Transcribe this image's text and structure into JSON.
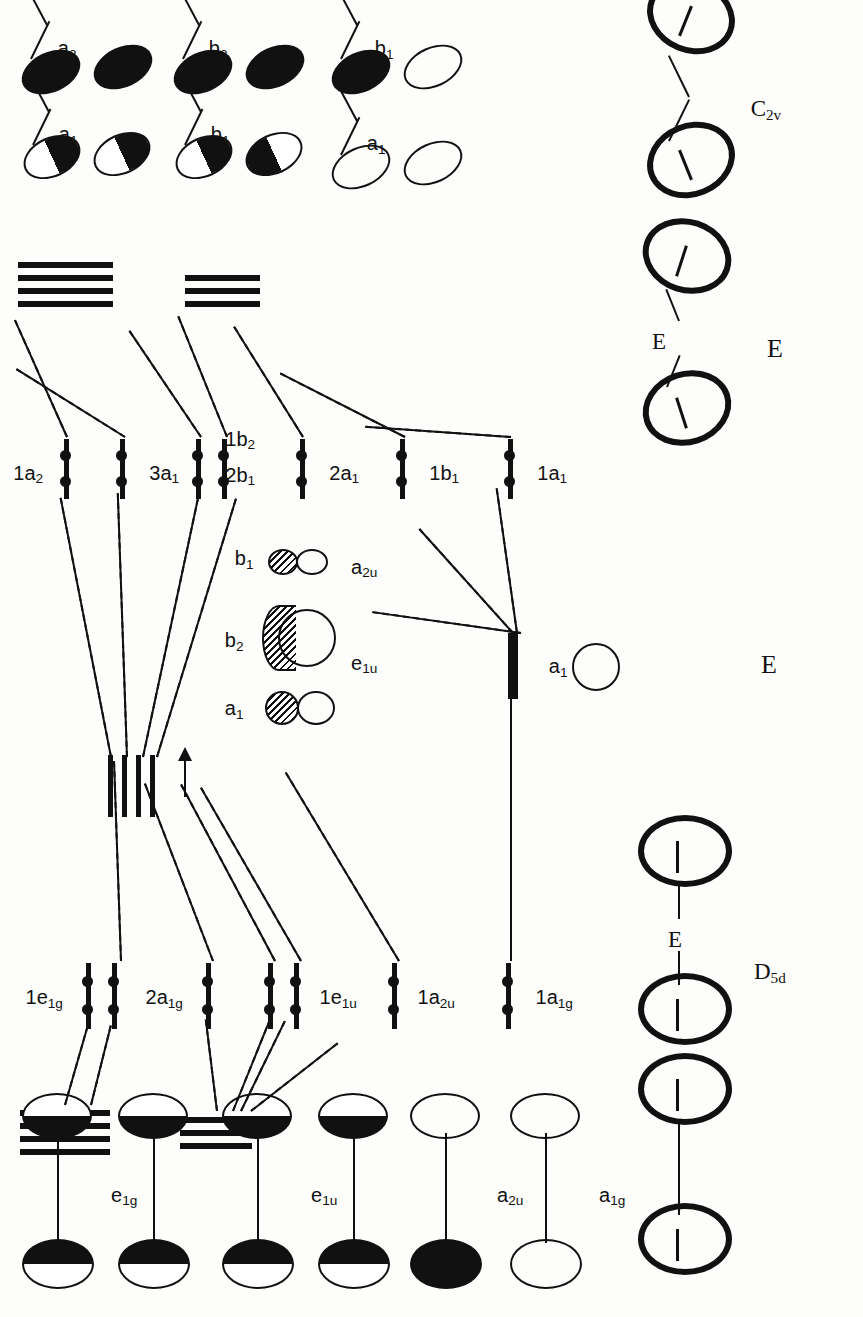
{
  "figure": {
    "number": "Figure 1-3",
    "caption_line1": "General molecular orbital diagrams for 14 electron main group sandwich complexes with parallel (D5d) and bent",
    "caption_line2": "(C2v) structures, showing only occupied molecular orbitals",
    "caption_full": "General molecular orbital diagrams for 14 electron main group sandwich complexes with parallel (D5d) and bent (C2v) structures, showing only occupied molecular orbitals"
  },
  "structures": {
    "row_labels": [
      "D5d",
      "E",
      "C2v"
    ],
    "parallel_label": "D5d",
    "central_atom_label": "E",
    "bent_label": "C2v",
    "items": [
      {
        "name": "cp2e-parallel-anion",
        "label": ""
      },
      {
        "name": "cp2e-parallel-with-e",
        "label": "D5d"
      },
      {
        "name": "central-element",
        "label": "E"
      },
      {
        "name": "cp2e-bent-with-e",
        "label": "E"
      },
      {
        "name": "cp2e-bent",
        "label": "C2v"
      }
    ]
  },
  "fragment_orbitals_left": {
    "title": "cyclopentadienyl fragment orbitals (D5d)",
    "labels": [
      "e1g",
      "e1u",
      "a2u",
      "a1g"
    ],
    "sets": [
      {
        "label": "e1g",
        "degeneracy": 2,
        "type": "pi"
      },
      {
        "label": "e1u",
        "degeneracy": 2,
        "type": "pi"
      },
      {
        "label": "a2u",
        "degeneracy": 1,
        "type": "pi"
      },
      {
        "label": "a1g",
        "degeneracy": 1,
        "type": "pi"
      }
    ]
  },
  "fragment_orbitals_right": {
    "title": "cyclopentadienyl fragment orbitals (C2v)",
    "labels": [
      "a1",
      "a2",
      "b1",
      "b2"
    ],
    "sets": [
      {
        "label": "a1",
        "degeneracy": 1
      },
      {
        "label": "a2",
        "degeneracy": 1
      },
      {
        "label": "b1",
        "degeneracy": 1
      },
      {
        "label": "b2",
        "degeneracy": 1
      }
    ]
  },
  "central_orbitals": {
    "caption": "central element valence orbitals",
    "d5d_labels": [
      "e1u",
      "a2u"
    ],
    "c2v_labels": [
      "a1",
      "b2",
      "b1"
    ],
    "items": [
      {
        "d5d": "e1u",
        "c2v_pair": [
          "a1",
          "b2"
        ]
      },
      {
        "d5d": "a2u",
        "c2v_pair": [
          "b1"
        ]
      }
    ]
  },
  "mo_levels_d5d": {
    "symmetry": "D5d",
    "levels": [
      {
        "label": "1e1g",
        "electrons": 4,
        "degeneracy": 2
      },
      {
        "label": "2a1g",
        "electrons": 2,
        "degeneracy": 1
      },
      {
        "label": "1e1u",
        "electrons": 4,
        "degeneracy": 2
      },
      {
        "label": "1a2u",
        "electrons": 2,
        "degeneracy": 1
      },
      {
        "label": "1a1g",
        "electrons": 2,
        "degeneracy": 1
      }
    ],
    "total_electrons": 14
  },
  "mo_levels_c2v": {
    "symmetry": "C2v",
    "levels": [
      {
        "label": "1a2",
        "electrons": 2,
        "degeneracy": 1
      },
      {
        "label": "3a1",
        "electrons": 2,
        "degeneracy": 1
      },
      {
        "label": "2b1",
        "electrons": 2,
        "degeneracy": 1
      },
      {
        "label": "1b2",
        "electrons": 2,
        "degeneracy": 1
      },
      {
        "label": "2a1",
        "electrons": 2,
        "degeneracy": 1
      },
      {
        "label": "1b1",
        "electrons": 2,
        "degeneracy": 1
      },
      {
        "label": "1a1",
        "electrons": 2,
        "degeneracy": 1
      }
    ],
    "total_electrons": 14
  },
  "center_fragment_levels": {
    "d5d_label": "a1",
    "c2v_label": "a1",
    "labels": [
      "a1",
      "a1"
    ]
  },
  "colors": {
    "ink": "#111111",
    "paper": "#fdfdfc"
  }
}
